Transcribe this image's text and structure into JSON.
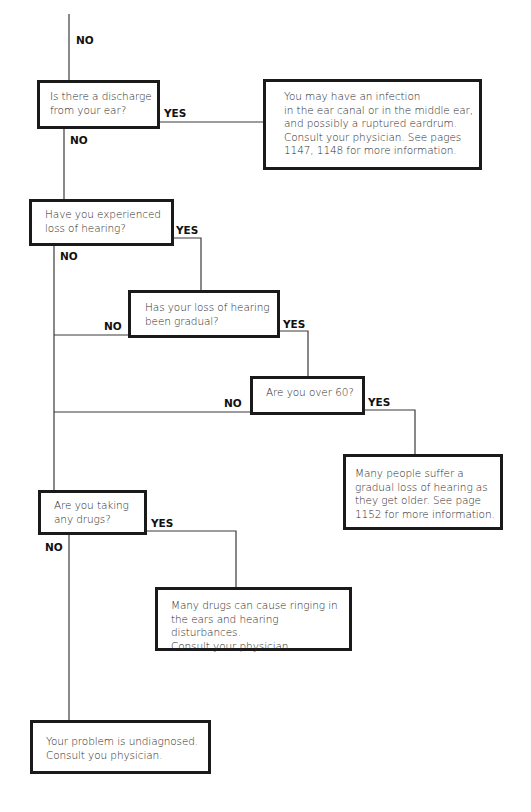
{
  "flowchart": {
    "nodes": [
      {
        "id": "q_discharge",
        "type": "question",
        "text": "Is there a discharge\nfrom your ear?"
      },
      {
        "id": "r_infection",
        "type": "result",
        "text": "You may have an infection\nin the ear canal or in the middle ear,\nand possibly a ruptured eardrum.\nConsult your physician. See pages\n1147, 1148 for more information."
      },
      {
        "id": "q_hearing_loss",
        "type": "question",
        "text": "Have you experienced\nloss of hearing?"
      },
      {
        "id": "q_gradual",
        "type": "question",
        "text": "Has your loss of hearing\nbeen gradual?"
      },
      {
        "id": "q_over60",
        "type": "question",
        "text": "Are you over 60?"
      },
      {
        "id": "r_age",
        "type": "result",
        "text": "Many people suffer a\ngradual loss of hearing as\nthey get older. See page\n1152 for more information."
      },
      {
        "id": "q_drugs",
        "type": "question",
        "text": "Are you taking\nany drugs?"
      },
      {
        "id": "r_drugs",
        "type": "result",
        "text": "Many drugs can cause ringing in\nthe ears and hearing disturbances.\nConsult your physician."
      },
      {
        "id": "r_undiagnosed",
        "type": "result",
        "text": "Your problem is undiagnosed.\nConsult you physician."
      }
    ],
    "edges": [
      {
        "from": "previous",
        "to": "q_discharge",
        "label": "NO"
      },
      {
        "from": "q_discharge",
        "to": "r_infection",
        "label": "YES"
      },
      {
        "from": "q_discharge",
        "to": "q_hearing_loss",
        "label": "NO"
      },
      {
        "from": "q_hearing_loss",
        "to": "q_gradual",
        "label": "YES"
      },
      {
        "from": "q_hearing_loss",
        "to": "q_drugs",
        "label": "NO"
      },
      {
        "from": "q_gradual",
        "to": "q_over60",
        "label": "YES"
      },
      {
        "from": "q_gradual",
        "to": "q_drugs",
        "label": "NO"
      },
      {
        "from": "q_over60",
        "to": "r_age",
        "label": "YES"
      },
      {
        "from": "q_over60",
        "to": "q_drugs",
        "label": "NO"
      },
      {
        "from": "q_drugs",
        "to": "r_drugs",
        "label": "YES"
      },
      {
        "from": "q_drugs",
        "to": "r_undiagnosed",
        "label": "NO"
      }
    ]
  },
  "labels": {
    "yes": "YES",
    "no": "NO"
  },
  "colors": {
    "line": "#333333",
    "border": "#1a1a1a",
    "background": "#ffffff"
  }
}
